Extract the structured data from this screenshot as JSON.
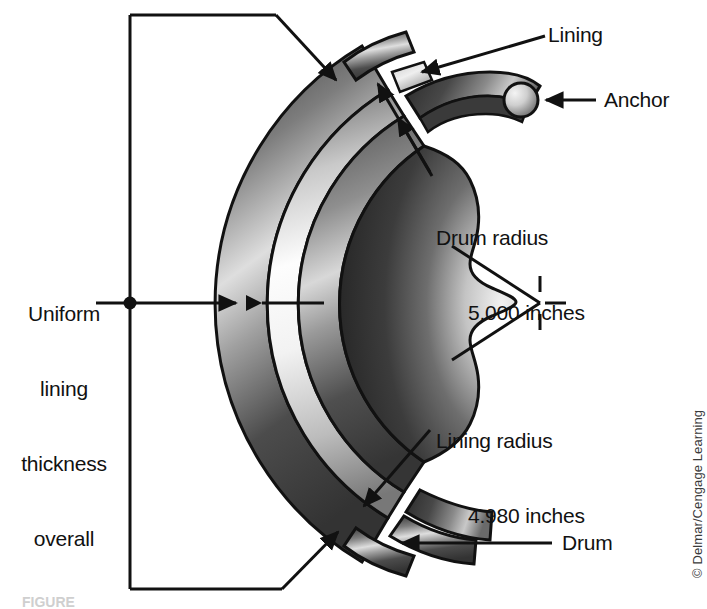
{
  "figure": {
    "background_color": "#ffffff",
    "line_color": "#111111"
  },
  "labels": {
    "uniform_thickness": {
      "line1": "Uniform",
      "line2": "lining",
      "line3": "thickness",
      "line4": "overall"
    },
    "lining": "Lining",
    "anchor": "Anchor",
    "drum_radius": {
      "line1": "Drum radius",
      "line2": "5.000 inches"
    },
    "lining_radius": {
      "line1": "Lining radius",
      "line2": "4.980 inches"
    },
    "drum": "Drum"
  },
  "measurements": {
    "drum_radius_value": "5.000",
    "drum_radius_units": "inches",
    "lining_radius_value": "4.980",
    "lining_radius_units": "inches"
  },
  "credit": {
    "text": "© Delmar/Cengage Learning"
  },
  "caption": {
    "text": "FIGURE"
  },
  "colors": {
    "drum_dark": "#3f3f3f",
    "drum_light": "#d6d6d6",
    "shoe_dark": "#2b2b2b",
    "shoe_light": "#e8e8e8",
    "lining_light": "#fafafa",
    "outline": "#111111",
    "anchor_light": "#f0f0f0",
    "anchor_dark": "#6f6f6f"
  }
}
